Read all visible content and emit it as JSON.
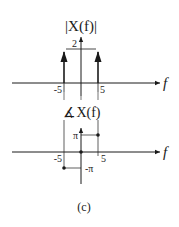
{
  "figure_label": "(c)",
  "magnitude_plot": {
    "title": "|X(f)|",
    "x_axis_label": "f",
    "amplitude_label": "2",
    "tick_labels": [
      "-5",
      "5"
    ],
    "impulses": [
      {
        "f": -5,
        "height": 2
      },
      {
        "f": 5,
        "height": 2
      }
    ]
  },
  "phase_plot": {
    "title": "∡X(f)",
    "x_axis_label": "f",
    "tick_labels": [
      "-5",
      "5"
    ],
    "level_labels": [
      "π",
      "-π"
    ],
    "points": [
      {
        "f": -5,
        "value": "-π"
      },
      {
        "f": 0,
        "value": "0"
      },
      {
        "f": 5,
        "value": "π"
      }
    ]
  },
  "colors": {
    "stroke": "#1a1a1a",
    "background": "#ffffff"
  }
}
